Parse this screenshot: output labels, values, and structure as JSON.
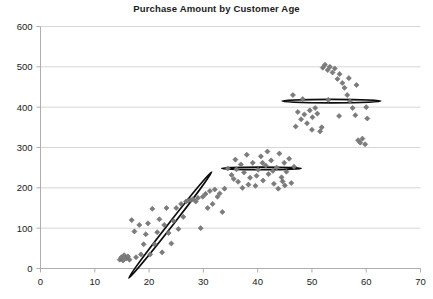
{
  "chart_data": {
    "type": "scatter",
    "title": "Purchase Amount by Customer Age",
    "xlabel": "",
    "ylabel": "",
    "xlim": [
      0,
      70
    ],
    "ylim": [
      0,
      600
    ],
    "xticks": [
      0,
      10,
      20,
      30,
      40,
      50,
      60,
      70
    ],
    "yticks": [
      0,
      100,
      200,
      300,
      400,
      500,
      600
    ],
    "grid": "horizontal",
    "legend": "none",
    "marker": "diamond",
    "marker_color": "#7c7c7c",
    "series": [
      {
        "name": "Young customers",
        "points": [
          [
            14.6,
            22
          ],
          [
            14.9,
            28
          ],
          [
            15.2,
            20
          ],
          [
            15.4,
            33
          ],
          [
            15.8,
            25
          ],
          [
            16.1,
            30
          ],
          [
            16.4,
            22
          ],
          [
            16.8,
            120
          ],
          [
            17.3,
            92
          ],
          [
            17.6,
            28
          ],
          [
            18.2,
            108
          ],
          [
            18.5,
            35
          ],
          [
            19.0,
            60
          ],
          [
            19.4,
            85
          ],
          [
            19.8,
            112
          ],
          [
            20.2,
            35
          ],
          [
            20.6,
            148
          ],
          [
            21.0,
            60
          ],
          [
            21.5,
            90
          ],
          [
            21.9,
            122
          ],
          [
            22.4,
            40
          ],
          [
            22.8,
            108
          ],
          [
            23.2,
            150
          ],
          [
            23.6,
            88
          ],
          [
            24.1,
            62
          ],
          [
            24.5,
            118
          ],
          [
            25.0,
            150
          ],
          [
            25.4,
            98
          ],
          [
            25.9,
            160
          ],
          [
            26.3,
            128
          ],
          [
            26.8,
            166
          ],
          [
            27.2,
            168
          ],
          [
            27.7,
            170
          ],
          [
            28.1,
            172
          ],
          [
            28.6,
            166
          ],
          [
            29.0,
            175
          ],
          [
            29.5,
            100
          ],
          [
            29.9,
            178
          ],
          [
            30.4,
            185
          ],
          [
            30.8,
            150
          ],
          [
            31.2,
            192
          ],
          [
            31.7,
            160
          ],
          [
            32.1,
            196
          ],
          [
            32.6,
            178
          ],
          [
            33.0,
            186
          ],
          [
            33.5,
            140
          ],
          [
            33.9,
            198
          ]
        ]
      },
      {
        "name": "Mid-age customers",
        "points": [
          [
            34.5,
            248
          ],
          [
            35.2,
            232
          ],
          [
            35.9,
            270
          ],
          [
            36.4,
            215
          ],
          [
            36.9,
            258
          ],
          [
            37.5,
            238
          ],
          [
            38.0,
            282
          ],
          [
            38.6,
            225
          ],
          [
            39.1,
            262
          ],
          [
            39.6,
            205
          ],
          [
            40.1,
            245
          ],
          [
            40.6,
            278
          ],
          [
            41.0,
            218
          ],
          [
            41.5,
            255
          ],
          [
            42.0,
            234
          ],
          [
            42.5,
            268
          ],
          [
            43.0,
            210
          ],
          [
            43.5,
            250
          ],
          [
            44.0,
            285
          ],
          [
            44.4,
            226
          ],
          [
            44.9,
            262
          ],
          [
            45.3,
            240
          ],
          [
            45.8,
            272
          ],
          [
            46.2,
            212
          ],
          [
            46.7,
            252
          ],
          [
            35.6,
            222
          ],
          [
            37.2,
            200
          ],
          [
            39.8,
            230
          ],
          [
            41.8,
            290
          ],
          [
            43.8,
            198
          ],
          [
            45.0,
            206
          ],
          [
            36.1,
            246
          ],
          [
            38.3,
            208
          ],
          [
            40.9,
            262
          ],
          [
            42.8,
            242
          ],
          [
            44.6,
            216
          ]
        ]
      },
      {
        "name": "Older customers",
        "points": [
          [
            46.5,
            430
          ],
          [
            47.4,
            388
          ],
          [
            48.0,
            370
          ],
          [
            48.6,
            382
          ],
          [
            49.1,
            360
          ],
          [
            49.6,
            392
          ],
          [
            50.1,
            375
          ],
          [
            50.6,
            398
          ],
          [
            51.0,
            384
          ],
          [
            51.5,
            340
          ],
          [
            52.0,
            498
          ],
          [
            52.4,
            505
          ],
          [
            52.9,
            492
          ],
          [
            53.3,
            500
          ],
          [
            53.8,
            486
          ],
          [
            54.2,
            496
          ],
          [
            54.7,
            470
          ],
          [
            55.1,
            482
          ],
          [
            55.6,
            460
          ],
          [
            56.0,
            448
          ],
          [
            56.5,
            430
          ],
          [
            57.0,
            415
          ],
          [
            57.5,
            398
          ],
          [
            58.0,
            380
          ],
          [
            58.5,
            318
          ],
          [
            58.9,
            312
          ],
          [
            59.3,
            322
          ],
          [
            59.8,
            308
          ],
          [
            60.2,
            372
          ],
          [
            58.2,
            455
          ],
          [
            56.8,
            472
          ],
          [
            55.0,
            378
          ],
          [
            53.0,
            418
          ],
          [
            51.8,
            350
          ],
          [
            50.0,
            344
          ],
          [
            48.3,
            420
          ],
          [
            47.0,
            352
          ],
          [
            60.0,
            400
          ]
        ]
      }
    ],
    "clusters": [
      {
        "name": "cluster-young",
        "cx": 23.9,
        "cy": 108,
        "rx": 12.4,
        "ry": 5.1,
        "rotation": -52
      },
      {
        "name": "cluster-midage",
        "cx": 40.7,
        "cy": 248,
        "rx": 7.3,
        "ry": 3.1,
        "rotation": 0
      },
      {
        "name": "cluster-older",
        "cx": 53.6,
        "cy": 415,
        "rx": 9.1,
        "ry": 4.4,
        "rotation": 0
      }
    ]
  },
  "axes": {
    "x_tick_labels": [
      "0",
      "10",
      "20",
      "30",
      "40",
      "50",
      "60",
      "70"
    ],
    "y_tick_labels": [
      "0",
      "100",
      "200",
      "300",
      "400",
      "500",
      "600"
    ]
  },
  "colors": {
    "marker": "#7c7c7c",
    "marker_edge": "#6a6a6a",
    "ellipse": "#0d0d0d",
    "grid": "#d6d6d6",
    "axis": "#aeaeae",
    "text": "#1b1b1b",
    "background": "#ffffff"
  }
}
